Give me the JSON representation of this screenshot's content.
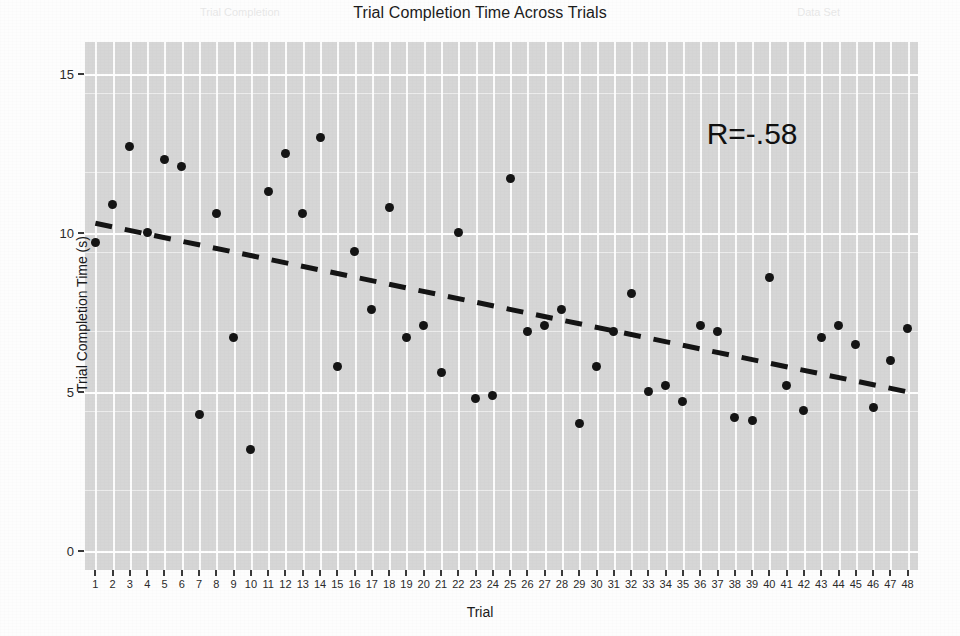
{
  "chart_data": {
    "type": "scatter",
    "title": "Trial Completion Time Across Trials",
    "xlabel": "Trial",
    "ylabel": "Trial Completion Time (s)",
    "xlim": [
      0.4,
      48.6
    ],
    "ylim": [
      -0.6,
      16.0
    ],
    "xticks": [
      1,
      2,
      3,
      4,
      5,
      6,
      7,
      8,
      9,
      10,
      11,
      12,
      13,
      14,
      15,
      16,
      17,
      18,
      19,
      20,
      21,
      22,
      23,
      24,
      25,
      26,
      27,
      28,
      29,
      30,
      31,
      32,
      33,
      34,
      35,
      36,
      37,
      38,
      39,
      40,
      41,
      42,
      43,
      44,
      45,
      46,
      47,
      48
    ],
    "yticks": [
      0,
      5,
      10,
      15
    ],
    "grid": true,
    "legend": "none",
    "panel_background": "#d6d6d6",
    "gridline_color": "#ffffff",
    "point_color": "#141414",
    "trendline_color": "#141414",
    "annotations": [
      {
        "text": "R=-.58",
        "x": 39.0,
        "y": 13.1
      }
    ],
    "series": [
      {
        "name": "Trial Completion Time",
        "x": [
          1,
          2,
          3,
          4,
          5,
          6,
          7,
          8,
          9,
          10,
          11,
          12,
          13,
          14,
          15,
          16,
          17,
          18,
          19,
          20,
          21,
          22,
          23,
          24,
          25,
          26,
          27,
          28,
          29,
          30,
          31,
          32,
          33,
          34,
          35,
          36,
          37,
          38,
          39,
          40,
          41,
          42,
          43,
          44,
          45,
          46,
          47,
          48
        ],
        "values": [
          9.7,
          10.9,
          12.7,
          10.0,
          12.3,
          12.1,
          4.3,
          10.6,
          6.7,
          3.2,
          11.3,
          12.5,
          10.6,
          13.0,
          5.8,
          9.4,
          7.6,
          10.8,
          6.7,
          7.1,
          5.6,
          10.0,
          4.8,
          4.9,
          11.7,
          6.9,
          7.1,
          7.6,
          4.0,
          5.8,
          6.9,
          8.1,
          5.0,
          5.2,
          4.7,
          7.1,
          6.9,
          4.2,
          4.1,
          8.6,
          5.2,
          4.4,
          6.7,
          7.1,
          6.5,
          4.5,
          6.0,
          7.0
        ]
      }
    ],
    "trendline": {
      "style": "dashed",
      "x_start": 1,
      "y_start": 10.3,
      "x_end": 48,
      "y_end": 5.0,
      "slope": -0.1128,
      "intercept": 10.41
    },
    "ghost_watermark": {
      "left": "Trial Completion",
      "right": "Data Set"
    }
  }
}
